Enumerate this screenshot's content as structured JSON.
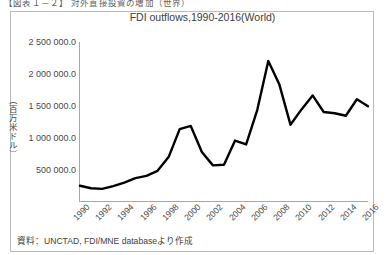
{
  "document": {
    "caption": "【図表１－２】 対外直接投資の増加（世界）"
  },
  "source_note": "資料：UNCTAD, FDI/MNE databaseより作成",
  "chart_data": {
    "type": "line",
    "title": "FDI outflows,1990-2016(World)",
    "xlabel": "",
    "ylabel": "（百万米ドル）",
    "ylim": [
      0,
      2500000
    ],
    "yticks": [
      500000,
      1000000,
      1500000,
      2000000,
      2500000
    ],
    "ytick_labels": [
      "500 000.0",
      "1 000 000.0",
      "1 500 000.0",
      "2 000 000.0",
      "2 500 000.0"
    ],
    "xlim": [
      1990,
      2016
    ],
    "xticks": [
      1990,
      1992,
      1994,
      1996,
      1998,
      2000,
      2002,
      2004,
      2006,
      2008,
      2010,
      2012,
      2014,
      2016
    ],
    "xtick_labels": [
      "1990",
      "1992",
      "1994",
      "1996",
      "1998",
      "2000",
      "2002",
      "2004",
      "2006",
      "2008",
      "2010",
      "2012",
      "2014",
      "2016"
    ],
    "grid": false,
    "legend": false,
    "line_color": "#000000",
    "series": [
      {
        "name": "FDI outflows (World)",
        "x": [
          1990,
          1991,
          1992,
          1993,
          1994,
          1995,
          1996,
          1997,
          1998,
          1999,
          2000,
          2001,
          2002,
          2003,
          2004,
          2005,
          2006,
          2007,
          2008,
          2009,
          2010,
          2011,
          2012,
          2013,
          2014,
          2015,
          2016
        ],
        "values": [
          240000,
          200000,
          190000,
          235000,
          290000,
          360000,
          395000,
          475000,
          690000,
          1130000,
          1180000,
          770000,
          560000,
          570000,
          950000,
          890000,
          1430000,
          2200000,
          1830000,
          1200000,
          1440000,
          1660000,
          1400000,
          1380000,
          1340000,
          1600000,
          1490000
        ]
      }
    ]
  }
}
